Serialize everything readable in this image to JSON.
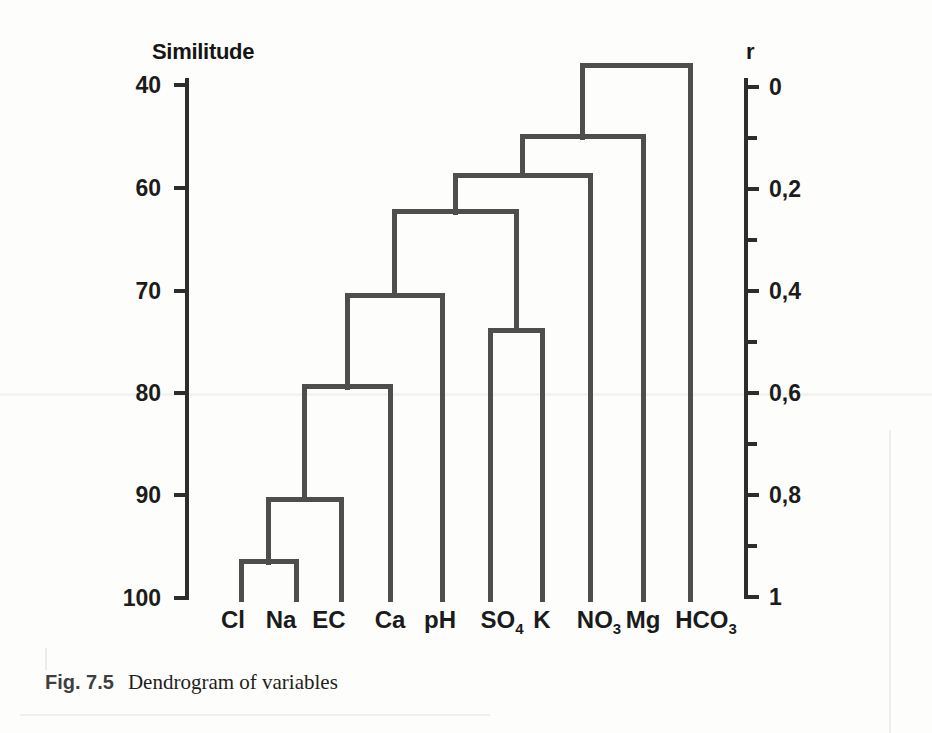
{
  "figure": {
    "caption_label": "Fig. 7.5",
    "caption_text": "Dendrogram of variables"
  },
  "colors": {
    "dendrogram_line": "#4e4e4e",
    "axis_line": "#2d2d2d",
    "text": "#1b1b1b",
    "page_background": "#fdfdfb"
  },
  "chart_data": {
    "type": "dendrogram",
    "orientation": "leaves-bottom",
    "left_axis": {
      "title": "Similitude",
      "ticks": [
        {
          "label": "40",
          "y": 85
        },
        {
          "label": "60",
          "y": 188
        },
        {
          "label": "70",
          "y": 291
        },
        {
          "label": "80",
          "y": 393
        },
        {
          "label": "90",
          "y": 495
        },
        {
          "label": "100",
          "y": 598
        }
      ]
    },
    "right_axis": {
      "title": "r",
      "range": [
        0,
        1
      ],
      "major_ticks": [
        {
          "label": "0",
          "r": 0
        },
        {
          "label": "0,2",
          "r": 0.2
        },
        {
          "label": "0,4",
          "r": 0.4
        },
        {
          "label": "0,6",
          "r": 0.6
        },
        {
          "label": "0,8",
          "r": 0.8
        },
        {
          "label": "1",
          "r": 1
        }
      ],
      "minor_ticks": [
        0.1,
        0.3,
        0.5,
        0.7,
        0.9
      ]
    },
    "leaves": [
      {
        "id": "Cl",
        "name": "Cl",
        "label": "Cl",
        "sub": "",
        "x": 241,
        "label_x": 233
      },
      {
        "id": "Na",
        "name": "Na",
        "label": "Na",
        "sub": "",
        "x": 296,
        "label_x": 281
      },
      {
        "id": "EC",
        "name": "EC",
        "label": "EC",
        "sub": "",
        "x": 341,
        "label_x": 329
      },
      {
        "id": "Ca",
        "name": "Ca",
        "label": "Ca",
        "sub": "",
        "x": 390,
        "label_x": 390
      },
      {
        "id": "pH",
        "name": "pH",
        "label": "pH",
        "sub": "",
        "x": 442,
        "label_x": 440
      },
      {
        "id": "SO4",
        "name": "SO4",
        "label": "SO",
        "sub": "4",
        "x": 490,
        "label_x": 502
      },
      {
        "id": "K",
        "name": "K",
        "label": "K",
        "sub": "",
        "x": 542,
        "label_x": 542
      },
      {
        "id": "NO3",
        "name": "NO3",
        "label": "NO",
        "sub": "3",
        "x": 590,
        "label_x": 599
      },
      {
        "id": "Mg",
        "name": "Mg",
        "label": "Mg",
        "sub": "",
        "x": 643,
        "label_x": 643
      },
      {
        "id": "HCO3",
        "name": "HCO3",
        "label": "HCO",
        "sub": "3",
        "x": 690,
        "label_x": 706
      }
    ],
    "merges": [
      {
        "id": "M1",
        "children": [
          "Cl",
          "Na"
        ],
        "r": 0.931,
        "similitude": 96.5
      },
      {
        "id": "M2",
        "children": [
          "M1",
          "EC"
        ],
        "r": 0.808,
        "similitude": 90.5
      },
      {
        "id": "M3",
        "children": [
          "M2",
          "Ca"
        ],
        "r": 0.588,
        "similitude": 79.5
      },
      {
        "id": "M4",
        "children": [
          "M3",
          "pH"
        ],
        "r": 0.408,
        "similitude": 70.5
      },
      {
        "id": "M5",
        "children": [
          "SO4",
          "K"
        ],
        "r": 0.478,
        "similitude": 74
      },
      {
        "id": "M6",
        "children": [
          "M4",
          "M5"
        ],
        "r": 0.245,
        "similitude": 62.5
      },
      {
        "id": "M7",
        "children": [
          "M6",
          "NO3"
        ],
        "r": 0.173,
        "similitude": 58.5
      },
      {
        "id": "M8",
        "children": [
          "M7",
          "Mg"
        ],
        "r": 0.098,
        "similitude": 55
      },
      {
        "id": "M9",
        "children": [
          "M8",
          "HCO3"
        ],
        "r": -0.043,
        "similitude": 36
      }
    ],
    "layout": {
      "canvas_w": 932,
      "canvas_h": 733,
      "left_axis_x": 185,
      "right_axis_x": 744,
      "axis_top_y": 78,
      "left_axis_bottom_y": 600,
      "right_axis_bottom_y": 599,
      "r0_y": 87,
      "r1_y": 597,
      "leaf_bottom_y": 602,
      "label_top_y": 608,
      "line_w": 5,
      "axis_w": 4,
      "tick_len": 11,
      "minor_tick_len": 9,
      "left_title_pos": [
        152,
        41
      ],
      "right_title_pos": [
        746,
        41
      ],
      "right_label_dx": 21,
      "left_label_gap": 13
    }
  }
}
